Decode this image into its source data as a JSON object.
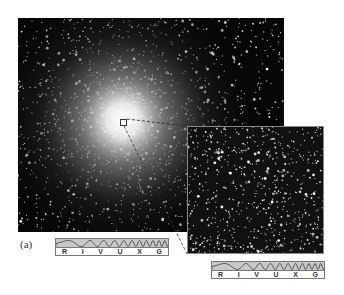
{
  "figure": {
    "panel_label": "(a)",
    "main_image": {
      "subject": "globular-star-cluster",
      "description": "Dense star cluster with bright core"
    },
    "inset_image": {
      "subject": "zoomed-cluster-core",
      "description": "Magnified view of marked region"
    },
    "spectrum_bars": [
      {
        "bands": [
          "R",
          "I",
          "V",
          "U",
          "X",
          "G"
        ]
      },
      {
        "bands": [
          "R",
          "I",
          "V",
          "U",
          "X",
          "G"
        ]
      }
    ]
  }
}
